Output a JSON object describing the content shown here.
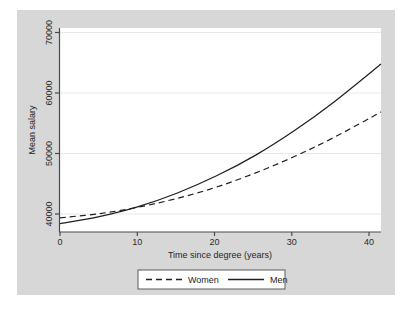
{
  "chart_data": {
    "type": "line",
    "title": "",
    "xlabel": "Time since degree (years)",
    "ylabel": "Mean salary",
    "xlim": [
      0,
      41
    ],
    "ylim": [
      37000,
      71500
    ],
    "xticks": [
      "0",
      "10",
      "20",
      "30",
      "40"
    ],
    "xtick_values": [
      0,
      10,
      20,
      30,
      40
    ],
    "yticks": [
      "40000",
      "50000",
      "60000",
      "70000"
    ],
    "ytick_values": [
      40000,
      50000,
      60000,
      70000
    ],
    "grid": "horizontal",
    "legend_position": "bottom-center",
    "x": [
      0,
      5,
      10,
      15,
      20,
      25,
      30,
      35,
      41
    ],
    "series": [
      {
        "name": "Women",
        "style": "dashed",
        "color": "#1f1f1f",
        "values": [
          39400,
          40100,
          41200,
          42700,
          44600,
          47000,
          49800,
          53000,
          57300
        ]
      },
      {
        "name": "Men",
        "style": "solid",
        "color": "#1f1f1f",
        "values": [
          38400,
          39600,
          41300,
          43600,
          46500,
          50000,
          54200,
          59000,
          65400
        ]
      }
    ],
    "annotations": []
  },
  "legend": {
    "entries": [
      {
        "label": "Women",
        "style": "dashed"
      },
      {
        "label": "Men",
        "style": "solid"
      }
    ]
  },
  "colors": {
    "figure_background": "#ffffff",
    "panel_background": "#d7d7d7",
    "plot_background": "#ffffff",
    "grid": "#e6e6e6",
    "axis": "#4a4a4a",
    "text": "#1f1f1f"
  }
}
